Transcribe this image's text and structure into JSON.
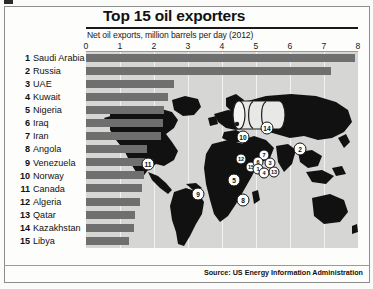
{
  "header": {
    "title": "Top 15 oil exporters",
    "subtitle": "Net oil exports, million barrels per day (2012)"
  },
  "source": "Source: US Energy Information Administration",
  "chart_data": {
    "type": "bar",
    "title": "Top 15 oil exporters",
    "subtitle": "Net oil exports, million barrels per day (2012)",
    "orientation": "horizontal",
    "xlabel": "Net oil exports, million barrels per day (2012)",
    "ylabel": "",
    "xlim": [
      0,
      8
    ],
    "xticks": [
      "0",
      "1",
      "2",
      "3",
      "4",
      "5",
      "6",
      "7",
      "8"
    ],
    "grid": true,
    "legend": "none",
    "categories": [
      "Saudi Arabia",
      "Russia",
      "UAE",
      "Kuwait",
      "Nigeria",
      "Iraq",
      "Iran",
      "Angola",
      "Venezuela",
      "Norway",
      "Canada",
      "Algeria",
      "Qatar",
      "Kazakhstan",
      "Libya"
    ],
    "ranks": [
      1,
      2,
      3,
      4,
      5,
      6,
      7,
      8,
      9,
      10,
      11,
      12,
      13,
      14,
      15
    ],
    "values": [
      7.9,
      7.2,
      2.6,
      2.4,
      2.3,
      2.25,
      2.2,
      1.8,
      1.75,
      1.7,
      1.65,
      1.6,
      1.45,
      1.4,
      1.25
    ],
    "units": "million barrels per day",
    "bar_color": "#6f6f6f",
    "plot_background": "#d6d6d4"
  },
  "map": {
    "markers": [
      {
        "label": "11",
        "country": "Canada"
      },
      {
        "label": "10",
        "country": "Norway"
      },
      {
        "label": "2",
        "country": "Russia"
      },
      {
        "label": "14",
        "country": "Kazakhstan"
      },
      {
        "label": "12",
        "country": "Algeria"
      },
      {
        "label": "15",
        "country": "Libya"
      },
      {
        "label": "7",
        "country": "Iran"
      },
      {
        "label": "6",
        "country": "Iraq"
      },
      {
        "label": "3",
        "country": "UAE"
      },
      {
        "label": "1",
        "country": "Saudi Arabia"
      },
      {
        "label": "4",
        "country": "Kuwait"
      },
      {
        "label": "13",
        "country": "Qatar"
      },
      {
        "label": "5",
        "country": "Nigeria"
      },
      {
        "label": "8",
        "country": "Angola"
      },
      {
        "label": "9",
        "country": "Venezuela"
      }
    ]
  }
}
